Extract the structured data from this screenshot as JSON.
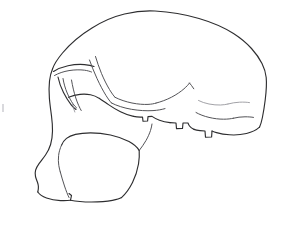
{
  "figure": {
    "view": "lateral (left profile, facing left)",
    "medium": "ink line drawing",
    "background_color": "#ffffff",
    "line_color": "#2e2e30",
    "secondary_line_color": "#4a4a4e",
    "faint_line_color": "#8a8a90",
    "canvas": {
      "width": 281,
      "height": 225
    }
  },
  "anatomy": {
    "regions": [
      {
        "id": "cranial-vault",
        "label": "Cranial vault",
        "description": "Long low-domed braincase sweeping from brow back to occiput"
      },
      {
        "id": "supraorbital-torus",
        "label": "Supraorbital torus",
        "description": "Heavy projecting brow ridge above the orbit"
      },
      {
        "id": "orbit",
        "label": "Orbit",
        "description": "Eye socket rim drawn as nested arcs below the brow"
      },
      {
        "id": "nasal-root",
        "label": "Nasal root / glabella",
        "description": "Depression at the front where brow meets the face"
      },
      {
        "id": "maxilla",
        "label": "Maxilla / muzzle",
        "description": "Forward projecting prognathic upper jaw"
      },
      {
        "id": "alveolar-margin",
        "label": "Alveolar margin",
        "description": "Lower tooth-bearing border of the upper jaw"
      },
      {
        "id": "zygomatic-arch",
        "label": "Zygomatic arch",
        "description": "Cheek bone arch running back toward the ear region"
      },
      {
        "id": "temporal-line",
        "label": "Temporal line",
        "description": "Faint curved lines on the side of the braincase"
      },
      {
        "id": "occipital",
        "label": "Occipital region",
        "description": "Rear base of the skull with angled nuchal plane"
      },
      {
        "id": "mastoid-process",
        "label": "Mastoid process",
        "description": "Small downward projection behind the ear opening"
      },
      {
        "id": "external-auditory-meatus",
        "label": "External auditory meatus",
        "description": "Ear opening notch at the base of the zygomatic arch"
      }
    ]
  },
  "strokes": {
    "outer_contour": "M 52.5 69.0 C 54.0 64.5 57.5 59.0 62.5 53.0 C 70.0 44.0 80.5 35.0 92.0 28.0 C 103.0 21.0 114.0 16.5 124.5 14.0 C 135.0 11.5 145.5 10.5 155.0 11.0 C 170.0 11.8 185.5 14.5 199.0 18.5 C 212.0 22.3 224.0 27.5 233.5 33.5 C 241.0 38.3 247.0 43.5 251.5 48.5 C 256.0 53.5 259.5 58.5 262.0 63.5 C 264.5 68.5 265.8 73.0 266.2 77.5 C 266.8 84.0 266.2 92.0 265.2 100.0 C 264.4 106.5 263.4 112.5 262.4 117.5 C 261.6 121.5 260.6 124.8 259.5 127.2",
    "occipital_base": "M 259.5 127.2 C 256.5 130.0 252.0 132.2 246.5 133.5 C 241.0 134.8 235.0 135.2 229.5 134.8 C 224.5 134.5 220.0 133.6 216.5 132.6 C 214.5 132.0 213.0 131.4 212.0 131.0",
    "occipital_step": "M 212.0 131.0 L 211.6 137.0 L 205.5 137.2 L 205.0 131.0 L 200.0 130.6 C 197.5 130.4 195.5 130.0 194.0 129.4",
    "mastoid_notch": "M 194.0 129.4 C 192.0 128.6 190.5 127.4 189.5 126.0 C 188.8 125.0 188.3 124.0 188.0 123.0 L 183.0 123.0 L 182.5 128.5 L 176.5 128.6 L 176.0 123.0 L 170.0 122.6",
    "basicranium_forward": "M 170.0 122.6 C 166.0 122.2 162.5 121.4 159.5 120.3 C 156.5 119.2 154.0 117.8 152.0 116.4 L 148.0 116.6 L 147.6 121.0 L 143.0 121.2 L 142.5 117.0 C 139.5 117.2 136.5 117.0 133.5 116.4",
    "zygomatic_lower": "M 133.5 116.4 C 129.0 115.5 124.5 113.8 120.5 111.8 C 116.0 109.6 112.0 107.0 108.5 104.6 C 105.0 102.2 102.0 100.0 99.5 98.4",
    "cheek_to_maxilla": "M 99.5 98.4 C 96.5 96.6 93.5 95.4 90.5 94.8 C 87.0 94.1 83.5 94.0 80.0 94.4 C 76.0 94.9 72.0 96.0 68.5 97.3",
    "face_front": "M 52.5 69.0 C 51.0 72.5 50.0 76.5 49.5 81.0 C 48.9 86.5 48.9 92.5 49.4 98.5 C 49.9 104.5 50.8 110.5 51.5 116.0 C 52.2 121.5 52.6 126.5 52.5 131.0 C 52.4 136.0 51.8 140.5 50.6 144.5 C 49.4 148.5 47.6 152.0 45.5 155.0 C 43.3 158.2 41.0 160.8 39.2 163.3 C 37.4 165.8 36.2 168.0 35.6 170.2 C 35.0 172.4 35.0 174.5 35.5 176.5 C 36.0 178.5 36.8 180.3 37.4 182.0 C 38.0 183.7 38.3 185.2 38.4 186.6 C 38.5 188.6 38.2 190.4 37.8 192.0",
    "alveolar_bottom_left": "M 37.8 192.0 C 39.5 194.5 42.5 196.5 46.5 198.0 C 50.5 199.5 55.5 200.4 60.5 200.6 C 64.5 200.8 68.0 200.6 70.5 200.2",
    "incisor_gap": "M 70.5 200.2 L 71.5 195.5 L 69.0 193.5",
    "alveolar_bottom_right": "M 70.5 200.2 C 76.0 201.4 83.5 202.0 91.5 202.0 C 99.5 202.0 107.0 201.4 112.5 200.4 C 117.0 199.6 120.0 198.6 121.5 197.6",
    "maxilla_back_edge": "M 121.5 197.6 C 125.5 194.0 129.5 188.5 132.5 182.5 C 135.5 176.5 137.5 170.0 138.5 164.0 C 139.3 159.0 139.5 154.5 139.2 150.5",
    "palate_upper_edge": "M 139.2 150.5 C 137.0 147.0 133.5 144.0 129.0 141.6 C 123.5 138.6 117.0 136.4 110.5 135.0 C 103.5 133.5 96.5 132.8 90.5 132.8 C 84.5 132.8 79.5 133.4 75.5 134.4 C 71.5 135.4 68.5 136.8 66.5 138.4 C 64.0 140.4 62.5 142.8 61.5 145.2",
    "palate_to_cheek": "M 61.5 145.2 C 60.0 148.5 59.0 152.0 58.6 155.5 C 58.2 159.0 58.3 162.5 58.8 165.5 C 59.2 168.0 59.8 170.2 60.3 172.0",
    "tooth_divider": "M 60.3 172.0 C 61.5 176.5 63.0 181.5 64.5 186.0 C 66.0 190.5 67.5 194.5 69.0 197.5",
    "cheek_post_edge": "M 139.2 150.5 C 141.5 147.5 144.0 144.0 146.0 140.5 C 148.0 137.0 149.5 133.5 150.5 130.5 C 151.3 128.0 151.8 125.8 152.0 124.0",
    "brow_ridge_top": "M 53.5 71.5 C 57.5 69.0 62.5 67.0 68.0 65.8 C 73.5 64.6 79.5 64.2 84.5 64.6 C 88.5 64.9 91.8 65.6 94.0 66.5",
    "brow_ridge_under": "M 54.5 75.5 C 58.5 73.2 63.5 71.5 69.0 70.6 C 74.5 69.7 80.0 69.6 84.5 70.2 C 87.5 70.6 89.8 71.3 91.5 72.0",
    "orbit_rim_outer": "M 58.0 77.0 C 59.0 82.0 61.0 87.5 63.5 92.5 C 66.0 97.5 68.8 101.8 71.2 104.8 C 73.0 107.0 74.6 108.5 76.0 109.5",
    "orbit_rim_inner": "M 63.0 78.5 C 63.8 83.5 65.3 88.5 67.2 93.0 C 69.1 97.5 71.2 101.2 73.0 103.8 C 74.3 105.7 75.5 107.0 76.5 107.8",
    "orbit_floor": "M 71.5 80.0 C 72.5 86.0 74.0 92.5 75.8 98.0 C 77.6 103.5 79.6 107.8 81.2 110.5",
    "orbit_interior_mark": "M 72.5 103.5 C 73.0 106.5 73.8 109.5 74.8 112.0",
    "temporal_line_upper": "M 95.5 56.5 C 97.0 61.5 99.0 67.5 101.5 73.5 C 104.0 79.5 106.8 85.0 109.5 89.5 C 111.6 93.0 113.5 95.6 115.0 97.3",
    "temporal_line_lower": "M 89.5 60.0 C 91.5 65.5 94.0 72.0 97.0 78.5 C 100.0 85.0 103.2 91.0 106.0 95.5 C 108.2 99.0 110.0 101.5 111.5 103.0",
    "supra_temporal_arc": "M 115.0 97.3 C 120.0 99.8 126.0 101.8 132.0 103.0 C 138.0 104.2 143.5 104.6 148.0 104.4 C 151.5 104.2 154.2 103.7 156.0 103.1",
    "zygomatic_upper": "M 111.5 103.0 C 117.0 105.8 124.0 108.0 131.5 109.3 C 139.0 110.6 146.5 111.0 153.0 110.6 C 158.0 110.3 162.0 109.5 165.0 108.6",
    "temporal_fossa_sweep": "M 156.0 103.1 C 161.0 101.8 166.5 99.8 171.5 97.2 C 176.5 94.6 180.8 91.6 184.0 88.8 C 186.5 86.6 188.4 84.6 189.5 83.0",
    "nuchal_line": "M 198.5 100.5 C 201.5 102.0 205.0 103.2 209.0 104.0 C 213.0 104.8 217.0 105.1 220.5 105.0 C 223.5 104.9 226.0 104.5 228.0 104.0",
    "nuchal_line_right": "M 228.0 104.0 C 231.5 103.0 235.5 102.4 239.5 102.2 C 243.5 102.0 247.0 102.2 249.5 102.6",
    "occipital_crest": "M 196.0 112.5 C 199.5 114.5 204.0 116.2 209.0 117.4 C 214.0 118.6 219.0 119.2 223.5 119.2 C 227.5 119.2 231.0 118.8 233.5 118.2",
    "occipital_crest_right": "M 233.5 118.2 C 237.0 117.3 241.0 116.8 245.0 116.8 C 248.5 116.8 251.5 117.0 253.5 117.4",
    "ear_region_mark": "M 189.5 83.0 C 190.8 84.5 192.3 86.5 193.8 88.8",
    "paper_speck": "M 2.0 104.0 L 4.0 104.0 L 4.0 112.0 L 2.0 112.0 Z"
  },
  "stroke_order": [
    "outer_contour",
    "occipital_base",
    "occipital_step",
    "mastoid_notch",
    "basicranium_forward",
    "zygomatic_lower",
    "cheek_to_maxilla",
    "face_front",
    "alveolar_bottom_left",
    "incisor_gap",
    "alveolar_bottom_right",
    "maxilla_back_edge",
    "palate_upper_edge",
    "palate_to_cheek",
    "tooth_divider",
    "cheek_post_edge",
    "brow_ridge_top",
    "brow_ridge_under",
    "orbit_rim_outer",
    "orbit_rim_inner",
    "orbit_floor",
    "orbit_interior_mark",
    "temporal_line_upper",
    "temporal_line_lower",
    "supra_temporal_arc",
    "zygomatic_upper",
    "temporal_fossa_sweep",
    "nuchal_line",
    "nuchal_line_right",
    "occipital_crest",
    "occipital_crest_right",
    "ear_region_mark"
  ]
}
